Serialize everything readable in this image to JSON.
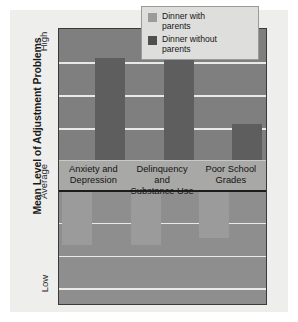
{
  "chart_data": {
    "type": "bar",
    "title": "",
    "subtitle": "",
    "xlabel": "",
    "ylabel": "Mean Level of Adjustment Problems",
    "categories": [
      "Anxiety and\nDepression",
      "Delinquency and\nSubstance Use",
      "Poor School\nGrades"
    ],
    "ytick_labels": [
      "High",
      "Average",
      "Low"
    ],
    "ylim": [
      -1.0,
      1.0
    ],
    "baseline_label": "Average",
    "grid": true,
    "legend_position": "top-right",
    "series": [
      {
        "name": "Dinner with parents",
        "color": "#9b9b9b",
        "values": [
          -0.49,
          -0.49,
          -0.42
        ],
        "direction": "below-average"
      },
      {
        "name": "Dinner without parents",
        "color": "#5e5e5e",
        "values": [
          0.82,
          0.82,
          0.41
        ],
        "direction": "above-average"
      }
    ]
  },
  "legend": {
    "items": [
      {
        "label": "Dinner with\nparents",
        "swatch": "light-gray-swatch"
      },
      {
        "label": "Dinner without\nparents",
        "swatch": "dark-gray-swatch"
      }
    ]
  },
  "axis": {
    "y_title": "Mean Level of Adjustment Problems",
    "tick_high": "High",
    "tick_average": "Average",
    "tick_low": "Low"
  },
  "colors": {
    "page_background": "#ffffff",
    "card_background": "#eeeeec",
    "plot_background": "#8e8e8e",
    "plot_upper_band": "#7f7f7f",
    "gridline": "#e9e9e7",
    "baseline": "#1c1c1c",
    "bar_light": "#9b9b9b",
    "bar_dark": "#5e5e5e",
    "category_strip": "#a8a8a6",
    "legend_background": "#dededc",
    "legend_border": "#9a9a98",
    "text": "#141414"
  }
}
